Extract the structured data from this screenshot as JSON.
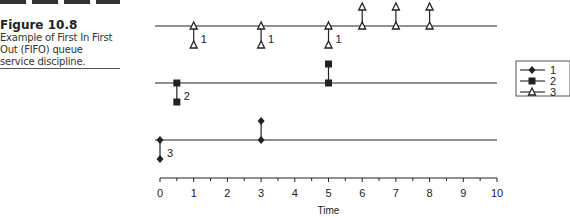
{
  "figure": {
    "number": "Figure 10.8",
    "caption_lines": [
      "Example of First In First",
      "Out (FIFO) queue",
      "service discipline."
    ]
  },
  "chart_data": {
    "type": "scatter",
    "title": "Example of First In First Out (FIFO) queue service discipline",
    "xlabel": "Time",
    "ylabel": "",
    "xlim": [
      0,
      10
    ],
    "xticks": [
      "0",
      "1",
      "2",
      "3",
      "4",
      "5",
      "6",
      "7",
      "8",
      "9",
      "10"
    ],
    "minor_ticks_step": 0.5,
    "grid": false,
    "legend_position": "right",
    "legend": [
      {
        "label": "1",
        "marker": "diamond"
      },
      {
        "label": "2",
        "marker": "square"
      },
      {
        "label": "3",
        "marker": "triangle"
      }
    ],
    "series": [
      {
        "name": "3",
        "marker": "triangle",
        "row": "top",
        "label": "1",
        "arrivals": [
          1,
          3,
          5
        ],
        "departures": [
          6,
          7,
          8
        ]
      },
      {
        "name": "2",
        "marker": "square",
        "row": "middle",
        "label": "2",
        "arrivals": [
          0.5
        ],
        "departures": [
          5
        ]
      },
      {
        "name": "1",
        "marker": "diamond",
        "row": "bottom",
        "label": "3",
        "arrivals": [
          0
        ],
        "departures": [
          3
        ]
      }
    ]
  }
}
